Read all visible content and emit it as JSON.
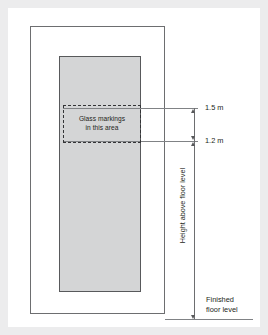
{
  "figure": {
    "marking_zone": {
      "line1": "Glass markings",
      "line2": "in this area"
    },
    "dimensions": [
      {
        "name": "upper-limit",
        "value": "1.5 m"
      },
      {
        "name": "lower-limit",
        "value": "1.2 m"
      }
    ],
    "vertical_caption": "Height above floor level",
    "floor": {
      "line1": "Finished",
      "line2": "floor level"
    },
    "colors": {
      "page_background": "#ececed",
      "card_background": "#ffffff",
      "glass_fill": "#d4d5d6",
      "glass_stroke": "#58595b",
      "frame_stroke": "#6d6e70",
      "dashed_stroke": "#333436",
      "leader_stroke": "#808285",
      "text": "#231f20"
    }
  }
}
